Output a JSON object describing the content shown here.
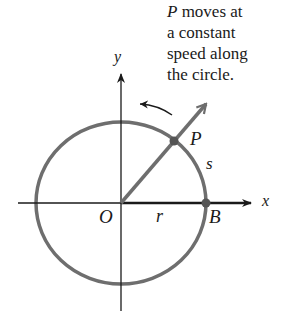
{
  "caption": {
    "point": "P",
    "line1_rest": " moves at",
    "line2": "a constant",
    "line3": "speed along",
    "line4": "the circle."
  },
  "labels": {
    "y_axis": "y",
    "x_axis": "x",
    "origin": "O",
    "radius": "r",
    "arc_length": "s",
    "moving_point": "P",
    "start_point": "B"
  },
  "colors": {
    "circle": "#6e6e6e",
    "axes": "#1a1a1a",
    "ray": "#6e6e6e",
    "text": "#1a1a1a"
  }
}
